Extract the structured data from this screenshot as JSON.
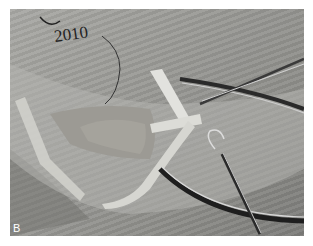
{
  "figure": {
    "panel_label": "B",
    "handwriting": "2010"
  }
}
